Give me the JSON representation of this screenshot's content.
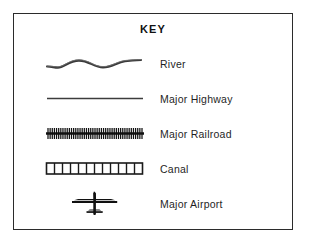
{
  "legend": {
    "title": "KEY",
    "border_color": "#2b2b2b",
    "background_color": "#ffffff",
    "ink_color": "#1a1a1a",
    "entries": [
      {
        "label": "River",
        "symbol": "wavy-line-symbol",
        "symbol_description": "tapered wavy sine-like line"
      },
      {
        "label": "Major Highway",
        "symbol": "straight-line-symbol",
        "symbol_description": "thin solid straight horizontal line"
      },
      {
        "label": "Major Railroad",
        "symbol": "crosshatched-line-symbol",
        "symbol_description": "horizontal line with many short perpendicular tie marks",
        "tie_count": 45
      },
      {
        "label": "Canal",
        "symbol": "segmented-bar-symbol",
        "symbol_description": "outlined rectangle divided into equal segments",
        "segment_count": 12
      },
      {
        "label": "Major Airport",
        "symbol": "airplane-icon",
        "symbol_description": "top-down airplane silhouette"
      }
    ]
  }
}
